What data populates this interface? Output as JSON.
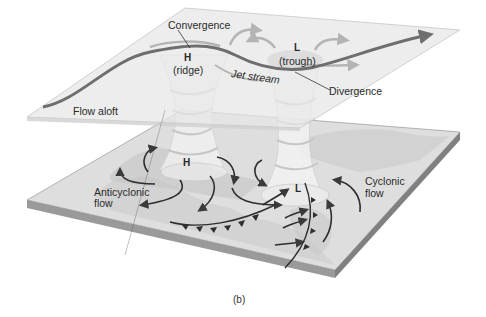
{
  "figure": {
    "caption": "(b)",
    "upper_level": {
      "labels": {
        "convergence": "Convergence",
        "high": "H",
        "ridge": "(ridge)",
        "low": "L",
        "trough": "(trough)",
        "jet_stream": "Jet stream",
        "divergence": "Divergence",
        "flow_aloft": "Flow aloft"
      }
    },
    "surface_level": {
      "labels": {
        "high": "H",
        "low": "L",
        "anticyclonic": "Anticyclonic",
        "anticyclonic_flow": "flow",
        "cyclonic": "Cyclonic",
        "cyclonic_flow": "flow"
      }
    },
    "colors": {
      "plane_fill": "#e4e4e4",
      "plane_edge": "#c8c8c8",
      "slab_top": "#dcdcdc",
      "slab_side": "#9a9a9a",
      "jet_stream": "#6e6e6e",
      "arrows": "#3a3a3a",
      "column": "#f2f2f2"
    }
  }
}
